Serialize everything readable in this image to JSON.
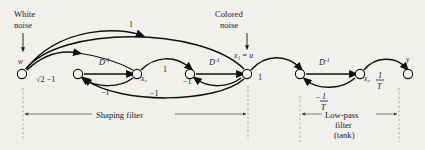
{
  "figure": {
    "type": "signal-flow-graph",
    "background_color": "#f2f0ec",
    "ink_color": "#101010",
    "annotations": {
      "white_noise": {
        "line1": "White",
        "line2": "noise"
      },
      "colored_noise": {
        "line1": "Colored",
        "line2": "noise"
      },
      "colored_noise_node": "x₁ = u"
    },
    "nodes": [
      {
        "id": "w",
        "label": "w",
        "x": 22,
        "y": 74,
        "label_pos": "above"
      },
      {
        "id": "n2",
        "label": "",
        "x": 78,
        "y": 74,
        "label_pos": "none"
      },
      {
        "id": "x2",
        "label": "x₂",
        "x": 137,
        "y": 74,
        "label_pos": "right"
      },
      {
        "id": "n4",
        "label": "",
        "x": 190,
        "y": 74,
        "label_pos": "none"
      },
      {
        "id": "x1",
        "label": "",
        "x": 247,
        "y": 74,
        "label_pos": "none"
      },
      {
        "id": "n6",
        "label": "",
        "x": 300,
        "y": 74,
        "label_pos": "none"
      },
      {
        "id": "x3",
        "label": "x₃",
        "x": 360,
        "y": 74,
        "label_pos": "right"
      },
      {
        "id": "y",
        "label": "y",
        "x": 408,
        "y": 74,
        "label_pos": "above"
      }
    ],
    "edge_labels": [
      {
        "id": "e-w-n2",
        "text": "√2 −1",
        "kind": "plain"
      },
      {
        "id": "e-n2-x2",
        "text": "D⁻¹",
        "kind": "operator"
      },
      {
        "id": "e-x2-n2",
        "text": "−1",
        "kind": "plain"
      },
      {
        "id": "e-arc-top1",
        "text": "1",
        "kind": "plain"
      },
      {
        "id": "e-x2-n4",
        "text": "1",
        "kind": "plain"
      },
      {
        "id": "e-arc-low",
        "text": "−1",
        "kind": "plain"
      },
      {
        "id": "e-n4-lbl",
        "text": "−1",
        "kind": "plain"
      },
      {
        "id": "e-n4-x1",
        "text": "D⁻¹",
        "kind": "operator"
      },
      {
        "id": "e-x1-n4",
        "text": "−1",
        "kind": "plain"
      },
      {
        "id": "e-x1-n6",
        "text": "1",
        "kind": "plain"
      },
      {
        "id": "e-n6-x3",
        "text": "D⁻¹",
        "kind": "operator"
      },
      {
        "id": "e-x3-n6",
        "text": "−1/T",
        "kind": "fraction",
        "numerator": "1",
        "denominator": "T",
        "sign": "−"
      },
      {
        "id": "e-x3-y",
        "text": "1/T",
        "kind": "fraction",
        "numerator": "1",
        "denominator": "T",
        "sign": ""
      }
    ],
    "captions": [
      {
        "id": "shaping-filter",
        "lines": [
          "Shaping filter"
        ]
      },
      {
        "id": "low-pass-filter",
        "lines": [
          "Low-pass",
          "filter",
          "(tank)"
        ]
      }
    ]
  }
}
